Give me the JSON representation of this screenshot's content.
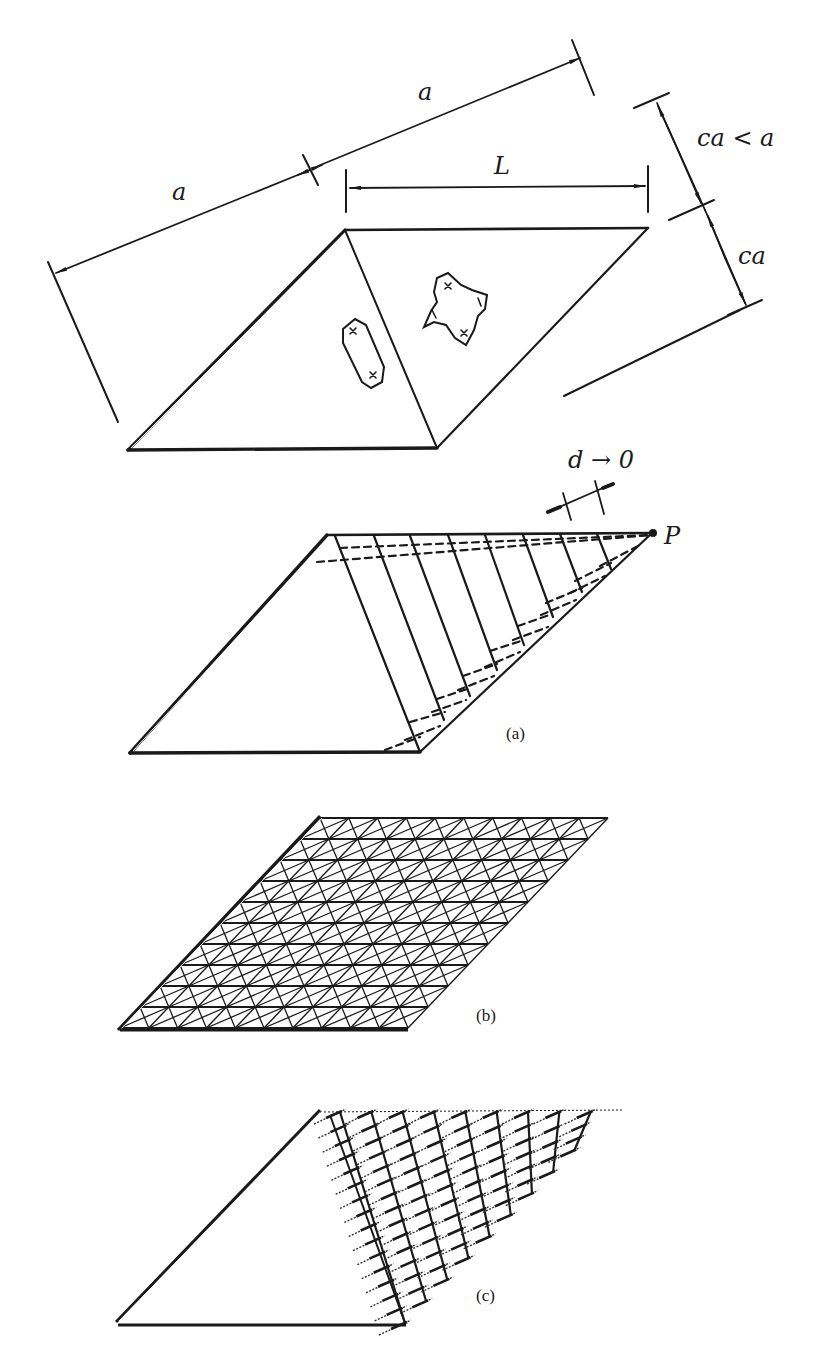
{
  "figure": {
    "top": {
      "dimension_labels": {
        "a_left": "a",
        "a_right": "a",
        "L": "L",
        "ca_lt_a": "ca < a",
        "ca": "ca"
      },
      "description": "Rhombic plate split by a diagonal into two triangles; left triangle with elongated hexagonal cutout, right triangle with cross-shaped cutout"
    },
    "part_a": {
      "caption": "(a)",
      "limit_label": "d → 0",
      "point_label": "P",
      "strip_count": 8
    },
    "part_b": {
      "caption": "(b)",
      "mesh_rows": 10,
      "mesh_cols": 10
    },
    "part_c": {
      "caption": "(c)",
      "strip_count": 9
    },
    "colors": {
      "ink": "#1a1a1a",
      "background": "#ffffff"
    }
  }
}
